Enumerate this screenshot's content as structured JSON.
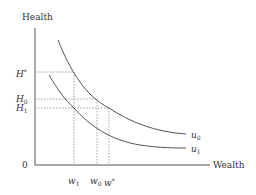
{
  "diagram": {
    "y_axis_label": "Health",
    "x_axis_label": "Wealth",
    "origin_label": "0",
    "y_ticks": [
      {
        "base": "H",
        "mark": "*",
        "kind": "sup"
      },
      {
        "base": "H",
        "mark": "0",
        "kind": "sub"
      },
      {
        "base": "H",
        "mark": "1",
        "kind": "sub"
      }
    ],
    "x_ticks": [
      {
        "base": "w",
        "mark": "1",
        "kind": "sub"
      },
      {
        "base": "w",
        "mark": "0",
        "kind": "sub"
      },
      {
        "base": "w",
        "mark": "*",
        "kind": "sup"
      }
    ],
    "curves": [
      {
        "base": "u",
        "mark": "0"
      },
      {
        "base": "u",
        "mark": "1"
      }
    ]
  }
}
